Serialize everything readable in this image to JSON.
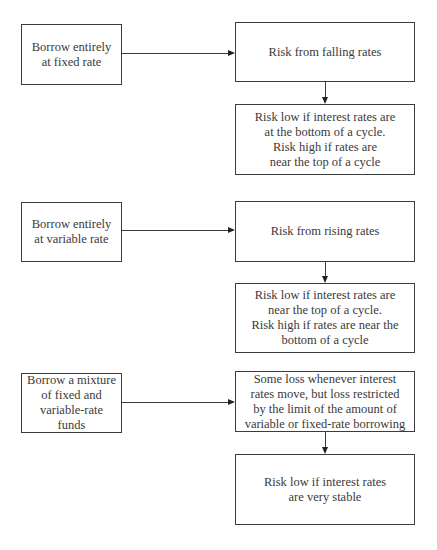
{
  "diagram": {
    "type": "flowchart",
    "rows": [
      {
        "strategy": "Borrow entirely\nat fixed rate",
        "risk": "Risk from falling rates",
        "outcome": "Risk low if interest rates are\nat the bottom of a cycle.\nRisk high if rates are\nnear the top of a cycle"
      },
      {
        "strategy": "Borrow entirely\nat variable rate",
        "risk": "Risk from rising rates",
        "outcome": "Risk low if interest rates are\nnear the top of a cycle.\nRisk high if rates are near the\nbottom of a cycle"
      },
      {
        "strategy": "Borrow a mixture\nof fixed and\nvariable-rate funds",
        "risk": "Some loss whenever interest\nrates move, but loss restricted\nby the limit of the amount of\nvariable or fixed-rate borrowing",
        "outcome": "Risk low if interest rates\nare very stable"
      }
    ],
    "edges": [
      {
        "from": "strategy-1",
        "to": "risk-1",
        "direction": "right"
      },
      {
        "from": "risk-1",
        "to": "outcome-1",
        "direction": "down"
      },
      {
        "from": "strategy-2",
        "to": "risk-2",
        "direction": "right"
      },
      {
        "from": "risk-2",
        "to": "outcome-2",
        "direction": "down"
      },
      {
        "from": "strategy-3",
        "to": "risk-3",
        "direction": "right"
      },
      {
        "from": "risk-3",
        "to": "outcome-3",
        "direction": "down"
      }
    ],
    "colors": {
      "line": "#3c3c3c",
      "text": "#3a3a3a",
      "background": "#ffffff"
    }
  }
}
